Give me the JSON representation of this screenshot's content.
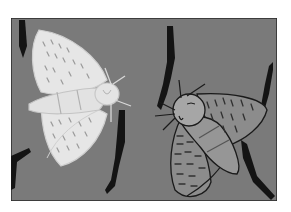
{
  "illustration": {
    "subject": "Two moths resting on tree bark: a light-colored moth and a dark-colored moth",
    "moths": [
      {
        "id": "light-moth",
        "shade": "light"
      },
      {
        "id": "dark-moth",
        "shade": "dark"
      }
    ],
    "colors": {
      "background": "#ffffff",
      "bark": "#7a7a7a",
      "frame_border": "#2a2a2a",
      "cracks": "#141414",
      "light_moth_fill": "#e6e6e6",
      "light_moth_outline": "#cfcfcf",
      "light_moth_marks": "#9a9a9a",
      "dark_moth_fill": "#8c8c8c",
      "dark_moth_head": "#a6a6a6",
      "dark_moth_outline": "#1a1a1a",
      "dark_moth_marks": "#303030"
    }
  }
}
